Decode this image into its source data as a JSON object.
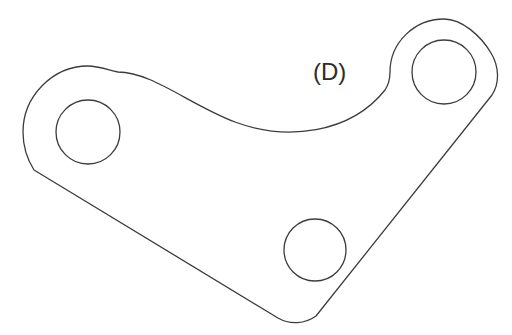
{
  "figure": {
    "background_color": "#ffffff",
    "stroke_color": "#3c3c3c",
    "fill_color": "#ffffff",
    "stroke_width": 1.3,
    "canvas": {
      "width": 512,
      "height": 335
    }
  },
  "labels": {
    "callout_d": {
      "text": "(D)",
      "x": 313,
      "y": 80,
      "font_size": 24,
      "color": "#2b2b2b"
    }
  },
  "geometry": {
    "outline_path": "M 88 66 C 53 66 23 96 23 132 C 23 146 27 159 34 170 L 278 318 C 290 325 305 324 316 316 L 492 95 C 500 83 499 66 491 53 C 481 36 462 19 444 19 C 414 19 390 43 390 72 C 390 79 389 84 385 90 C 350 134 286 141 235 122 C 190 105 152 72 118 72 C 108 70 99 66 88 66 Z",
    "holes": [
      {
        "name": "left-hole",
        "cx": 88,
        "cy": 132,
        "r": 32
      },
      {
        "name": "top-right-hole",
        "cx": 444,
        "cy": 72,
        "r": 32
      },
      {
        "name": "bottom-hole",
        "cx": 315,
        "cy": 250,
        "r": 31
      }
    ],
    "lobes": [
      {
        "name": "left-lobe",
        "cx": 88,
        "cy": 132,
        "outer_r": 66
      },
      {
        "name": "top-right-lobe",
        "cx": 444,
        "cy": 72,
        "outer_r": 53
      },
      {
        "name": "bottom-lobe",
        "cx": 312,
        "cy": 250,
        "outer_r": 70
      }
    ],
    "extremes": {
      "leftmost_x": 23,
      "rightmost_x": 496,
      "topmost_y": 19,
      "bottommost_y": 319,
      "top_edge_valley": {
        "x": 235,
        "y": 122
      }
    }
  }
}
